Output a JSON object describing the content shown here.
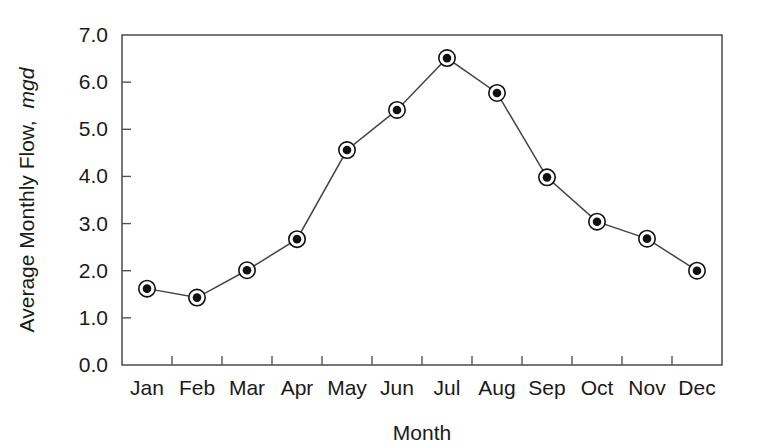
{
  "chart_data": {
    "type": "line",
    "title": "",
    "xlabel": "Month",
    "ylabel": "Average Monthly Flow, mgd",
    "ylabel_main": "Average Monthly Flow,",
    "ylabel_unit": "mgd",
    "categories": [
      "Jan",
      "Feb",
      "Mar",
      "Apr",
      "May",
      "Jun",
      "Jul",
      "Aug",
      "Sep",
      "Oct",
      "Nov",
      "Dec"
    ],
    "values": [
      1.62,
      1.43,
      2.01,
      2.67,
      4.56,
      5.41,
      6.51,
      5.77,
      3.98,
      3.04,
      2.68,
      2.0
    ],
    "series": [
      {
        "name": "Average Monthly Flow",
        "values": [
          1.62,
          1.43,
          2.01,
          2.67,
          4.56,
          5.41,
          6.51,
          5.77,
          3.98,
          3.04,
          2.68,
          2.0
        ]
      }
    ],
    "ylim": [
      0.0,
      7.0
    ],
    "ytick_labels": [
      "7.0",
      "6.0",
      "5.0",
      "4.0",
      "3.0",
      "2.0",
      "1.0",
      "0.0"
    ],
    "ytick_values": [
      7.0,
      6.0,
      5.0,
      4.0,
      3.0,
      2.0,
      1.0,
      0.0
    ],
    "grid": false,
    "legend": false,
    "legend_position": "none",
    "marker": "circle-with-dot",
    "line_color": "#444444",
    "marker_fill": "#ffffff",
    "marker_dot_color": "#111111",
    "axis_color": "#555555",
    "background_color": "#ffffff"
  }
}
